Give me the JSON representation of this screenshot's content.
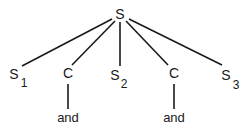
{
  "diagram": {
    "type": "parse-tree",
    "root": {
      "label": "S"
    },
    "children": [
      {
        "label": "S",
        "subscript": "1"
      },
      {
        "label": "C",
        "child": "and"
      },
      {
        "label": "S",
        "subscript": "2"
      },
      {
        "label": "C",
        "child": "and"
      },
      {
        "label": "S",
        "subscript": "3"
      }
    ]
  }
}
